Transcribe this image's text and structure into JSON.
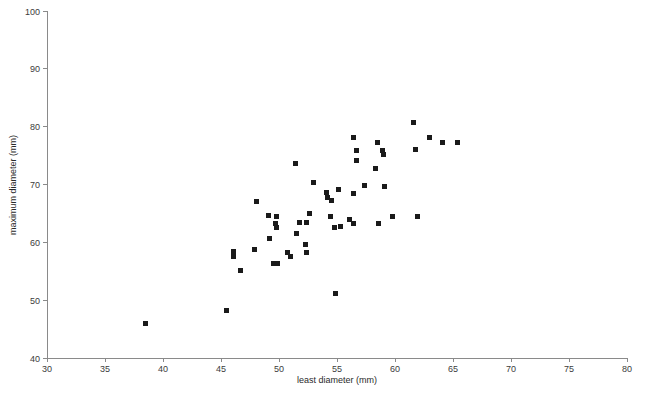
{
  "chart_data": {
    "type": "scatter",
    "title": "",
    "xlabel": "least diameter (mm)",
    "ylabel": "maximum diameter (mm)",
    "xlim": [
      30,
      80
    ],
    "ylim": [
      40,
      100
    ],
    "xticks": [
      30,
      35,
      40,
      45,
      50,
      55,
      60,
      65,
      70,
      75,
      80
    ],
    "yticks": [
      40,
      50,
      60,
      70,
      80,
      90,
      100
    ],
    "grid": false,
    "legend": null,
    "marker": {
      "shape": "square",
      "size_px": 5,
      "color": "#1a1a1a"
    },
    "points": [
      {
        "x": 38.5,
        "y": 45.9
      },
      {
        "x": 45.5,
        "y": 48.2
      },
      {
        "x": 46.1,
        "y": 58.5
      },
      {
        "x": 46.1,
        "y": 57.6
      },
      {
        "x": 46.7,
        "y": 55.2
      },
      {
        "x": 48.1,
        "y": 67.0
      },
      {
        "x": 47.9,
        "y": 58.7
      },
      {
        "x": 49.1,
        "y": 64.7
      },
      {
        "x": 49.2,
        "y": 60.6
      },
      {
        "x": 49.5,
        "y": 56.4
      },
      {
        "x": 49.7,
        "y": 63.3
      },
      {
        "x": 49.8,
        "y": 62.6
      },
      {
        "x": 49.8,
        "y": 64.5
      },
      {
        "x": 49.9,
        "y": 56.4
      },
      {
        "x": 50.7,
        "y": 58.2
      },
      {
        "x": 51.0,
        "y": 57.5
      },
      {
        "x": 51.4,
        "y": 73.7
      },
      {
        "x": 51.5,
        "y": 61.6
      },
      {
        "x": 51.8,
        "y": 63.5
      },
      {
        "x": 52.6,
        "y": 64.9
      },
      {
        "x": 53.0,
        "y": 70.4
      },
      {
        "x": 52.3,
        "y": 59.7
      },
      {
        "x": 52.4,
        "y": 58.3
      },
      {
        "x": 52.4,
        "y": 63.5
      },
      {
        "x": 54.1,
        "y": 68.7
      },
      {
        "x": 54.2,
        "y": 67.7
      },
      {
        "x": 54.4,
        "y": 64.4
      },
      {
        "x": 54.5,
        "y": 67.2
      },
      {
        "x": 54.8,
        "y": 62.5
      },
      {
        "x": 54.9,
        "y": 51.2
      },
      {
        "x": 55.1,
        "y": 69.2
      },
      {
        "x": 55.3,
        "y": 62.8
      },
      {
        "x": 56.1,
        "y": 63.9
      },
      {
        "x": 56.4,
        "y": 68.5
      },
      {
        "x": 56.4,
        "y": 78.2
      },
      {
        "x": 56.4,
        "y": 63.3
      },
      {
        "x": 56.7,
        "y": 75.9
      },
      {
        "x": 56.7,
        "y": 74.1
      },
      {
        "x": 57.4,
        "y": 69.9
      },
      {
        "x": 58.3,
        "y": 72.7
      },
      {
        "x": 58.5,
        "y": 77.2
      },
      {
        "x": 58.6,
        "y": 63.3
      },
      {
        "x": 58.9,
        "y": 75.9
      },
      {
        "x": 59.0,
        "y": 75.2
      },
      {
        "x": 59.1,
        "y": 69.6
      },
      {
        "x": 59.8,
        "y": 64.4
      },
      {
        "x": 61.6,
        "y": 80.8
      },
      {
        "x": 61.8,
        "y": 76.1
      },
      {
        "x": 61.9,
        "y": 64.4
      },
      {
        "x": 63.0,
        "y": 78.1
      },
      {
        "x": 64.1,
        "y": 77.2
      },
      {
        "x": 65.4,
        "y": 77.2
      }
    ]
  },
  "axes": {
    "x_title": "least diameter (mm)",
    "y_title": "maximum diameter (mm)"
  }
}
